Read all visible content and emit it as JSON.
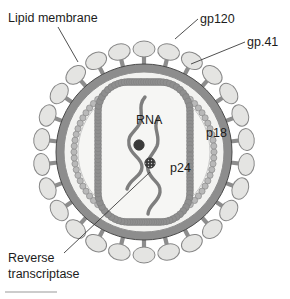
{
  "figure": {
    "background_color": "#ffffff",
    "footer_rule": {
      "name": "footer-rule",
      "x1": 5,
      "y1": 292,
      "x2": 57,
      "y2": 292,
      "color": "#9a9a9a"
    }
  },
  "palette": {
    "outline_dark": "#4a4a4a",
    "membrane_gray": "#8d8d8d",
    "membrane_light": "#cfcfcf",
    "knob_fill": "#e4e4e2",
    "knob_stroke": "#878787",
    "matrix_bead": "#b9b9b9",
    "matrix_bead_stroke": "#8a8a8a",
    "capsid_gray": "#8f8f8f",
    "interior_fill": "#f2f2f0",
    "core_fill": "#f6f6f4",
    "rna_gray": "#7e7e7e",
    "dot_dark": "#3a3a3a",
    "text_color": "#1c1c1c",
    "leader_color": "#3b3b3b"
  },
  "geometry": {
    "center_x": 144,
    "center_y": 152,
    "envelope_outer_radius": 92,
    "membrane_outer_radius": 88,
    "membrane_inner_radius": 80,
    "matrix_ring_radius": 70,
    "interior_radius": 66,
    "knob_count": 26,
    "knob_radius_offset": 103,
    "knob_rx": 11,
    "knob_ry": 8,
    "spike_count": 26,
    "capsid": {
      "x": 98,
      "y": 82,
      "width": 92,
      "height": 140,
      "corner_radius": 30
    }
  },
  "labels": [
    {
      "id": "lipid-membrane",
      "name": "label-lipid-membrane",
      "text": "Lipid membrane",
      "lines": [
        "Lipid membrane"
      ],
      "x": 8,
      "y": 22,
      "anchor": "start",
      "leader": [
        [
          58,
          27
        ],
        [
          78,
          62
        ]
      ]
    },
    {
      "id": "gp120",
      "name": "label-gp120",
      "text": "gp120",
      "lines": [
        "gp120"
      ],
      "x": 200,
      "y": 23,
      "anchor": "start",
      "leader": [
        [
          198,
          19
        ],
        [
          175,
          39
        ]
      ]
    },
    {
      "id": "gp41",
      "name": "label-gp41",
      "text": "gp.41",
      "lines": [
        "gp.41"
      ],
      "x": 247,
      "y": 46,
      "anchor": "start",
      "leader": [
        [
          245,
          42
        ],
        [
          191,
          64
        ]
      ]
    },
    {
      "id": "p18",
      "name": "label-p18",
      "text": "p18",
      "lines": [
        "p18"
      ],
      "x": 206,
      "y": 137,
      "anchor": "start",
      "leader": null
    },
    {
      "id": "rna",
      "name": "label-rna",
      "text": "RNA",
      "lines": [
        "RNA"
      ],
      "x": 136,
      "y": 124,
      "anchor": "start",
      "leader": null
    },
    {
      "id": "p24",
      "name": "label-p24",
      "text": "p24",
      "lines": [
        "p24"
      ],
      "x": 170,
      "y": 172,
      "anchor": "start",
      "leader": null
    },
    {
      "id": "reverse-transcriptase",
      "name": "label-reverse-transcriptase",
      "text": "Reverse transcriptase",
      "lines": [
        "Reverse",
        "transcriptase"
      ],
      "x": 8,
      "y": 262,
      "anchor": "start",
      "leader": [
        [
          64,
          253
        ],
        [
          150,
          172
        ]
      ]
    }
  ],
  "rna_strands": [
    {
      "id": "rna-strand-left",
      "name": "rna-strand-left",
      "path": "M 145 97 C 137 106 144 114 140 123 C 135 133 127 134 129 145 C 131 156 142 157 142 167 C 142 177 130 178 127 189"
    },
    {
      "id": "rna-strand-right",
      "name": "rna-strand-right",
      "path": "M 158 118 C 152 128 161 136 157 146 C 152 157 145 159 148 170 C 151 181 161 182 160 192 C 159 202 149 204 148 214"
    }
  ],
  "dots": [
    {
      "id": "rna-dot",
      "name": "rna-binding-dot",
      "cx": 139,
      "cy": 145,
      "r": 5.2,
      "style": "solid"
    },
    {
      "id": "reverse-transcriptase-dot",
      "name": "reverse-transcriptase-dot",
      "cx": 150,
      "cy": 163,
      "r": 5.2,
      "style": "hatched"
    }
  ]
}
